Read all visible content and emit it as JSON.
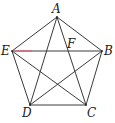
{
  "figure": {
    "type": "regular pentagon with all diagonals",
    "vertices": {
      "A": {
        "label": "A",
        "x": 57,
        "y": 17,
        "lx": 52,
        "ly": 13
      },
      "B": {
        "label": "B",
        "x": 102,
        "y": 51,
        "lx": 104,
        "ly": 55
      },
      "C": {
        "label": "C",
        "x": 86,
        "y": 105,
        "lx": 87,
        "ly": 117
      },
      "D": {
        "label": "D",
        "x": 30,
        "y": 105,
        "lx": 22,
        "ly": 117
      },
      "E": {
        "label": "E",
        "x": 12,
        "y": 51,
        "lx": 1,
        "ly": 55
      },
      "F": {
        "label": "F",
        "x": 69,
        "y": 51,
        "lx": 67,
        "ly": 48
      }
    },
    "sides": [
      "AB",
      "BC",
      "CD",
      "DE",
      "EA"
    ],
    "diagonals": [
      "AC",
      "AD",
      "BD",
      "BE",
      "CE"
    ],
    "highlighted_segment": {
      "from": "E",
      "to_x": 32,
      "y": 51,
      "color": "#e0607e"
    },
    "edge_color": "#3a3a3a"
  }
}
